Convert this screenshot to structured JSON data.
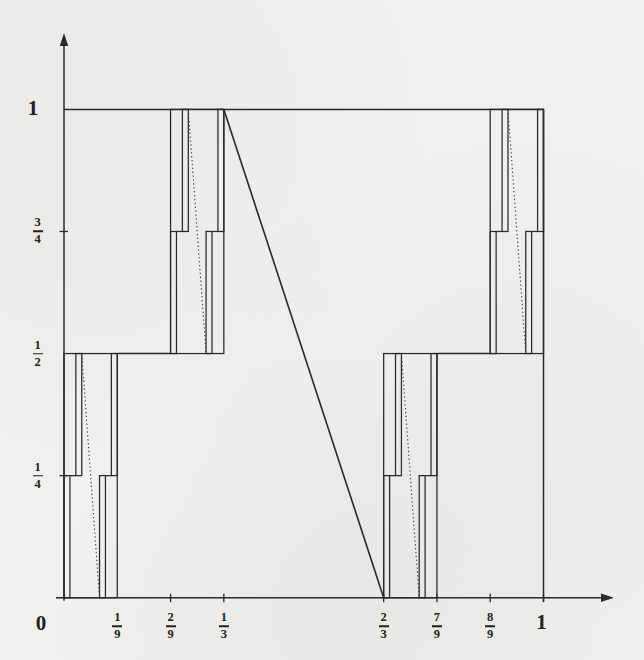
{
  "figure": {
    "paper_color": "#f1f0eb",
    "ink_color": "#2a2a27",
    "dotted_color": "#3c3c38"
  },
  "chart_data": {
    "type": "line",
    "title": "",
    "xlabel": "",
    "ylabel": "",
    "xlim": [
      0,
      1
    ],
    "ylim": [
      0,
      1
    ],
    "grid": false,
    "legend": false,
    "x_tick_labels": [
      "0",
      "1/9",
      "2/9",
      "1/3",
      "2/3",
      "7/9",
      "8/9",
      "1"
    ],
    "y_tick_labels": [
      "0",
      "1/4",
      "1/2",
      "3/4",
      "1"
    ],
    "unit_square_outline": true,
    "main_diagonal": [
      [
        0.333333,
        1
      ],
      [
        0.666667,
        0
      ]
    ],
    "level1_flat_segments": [
      [
        0.111111,
        0.222222,
        0.5
      ],
      [
        0.777778,
        0.888889,
        0.5
      ]
    ],
    "block_scale": {
      "sx": 0.111111,
      "sy": 0.5
    },
    "blocks": [
      {
        "name": "bottom-left",
        "ox": 0,
        "oy": 0
      },
      {
        "name": "upper-left",
        "ox": 0.222222,
        "oy": 0.5
      },
      {
        "name": "bottom-right",
        "ox": 0.666667,
        "oy": 0
      },
      {
        "name": "upper-right",
        "ox": 0.888889,
        "oy": 0.5
      }
    ],
    "block_pattern": {
      "subrects": [
        [
          0,
          0.111111,
          0,
          0.5
        ],
        [
          0.222222,
          0.333333,
          0.5,
          1
        ],
        [
          0.666667,
          0.777778,
          0,
          0.5
        ],
        [
          0.888889,
          1,
          0.5,
          1
        ]
      ],
      "flats": [
        [
          0.111111,
          0.222222,
          0.5
        ],
        [
          0.777778,
          0.888889,
          0.5
        ]
      ],
      "diagonal": [
        [
          0.333333,
          1
        ],
        [
          0.666667,
          0
        ]
      ],
      "diagonal_style": "dotted"
    }
  },
  "axes": {
    "x": {
      "origin_label": "0",
      "ticks": [
        {
          "num": "1",
          "den": "9",
          "u": 0.111111,
          "tick": false
        },
        {
          "num": "2",
          "den": "9",
          "u": 0.222222,
          "tick": true
        },
        {
          "num": "1",
          "den": "3",
          "u": 0.333333,
          "tick": true
        },
        {
          "num": "2",
          "den": "3",
          "u": 0.666667,
          "tick": true
        },
        {
          "num": "7",
          "den": "9",
          "u": 0.777778,
          "tick": true
        },
        {
          "num": "8",
          "den": "9",
          "u": 0.888889,
          "tick": true
        },
        {
          "label": "1",
          "u": 1,
          "tick": true
        }
      ]
    },
    "y": {
      "ticks": [
        {
          "num": "1",
          "den": "4",
          "v": 0.25,
          "tick": true
        },
        {
          "num": "1",
          "den": "2",
          "v": 0.5,
          "tick": false
        },
        {
          "num": "3",
          "den": "4",
          "v": 0.75,
          "tick": true
        },
        {
          "label": "1",
          "v": 1,
          "tick": false
        }
      ]
    }
  }
}
